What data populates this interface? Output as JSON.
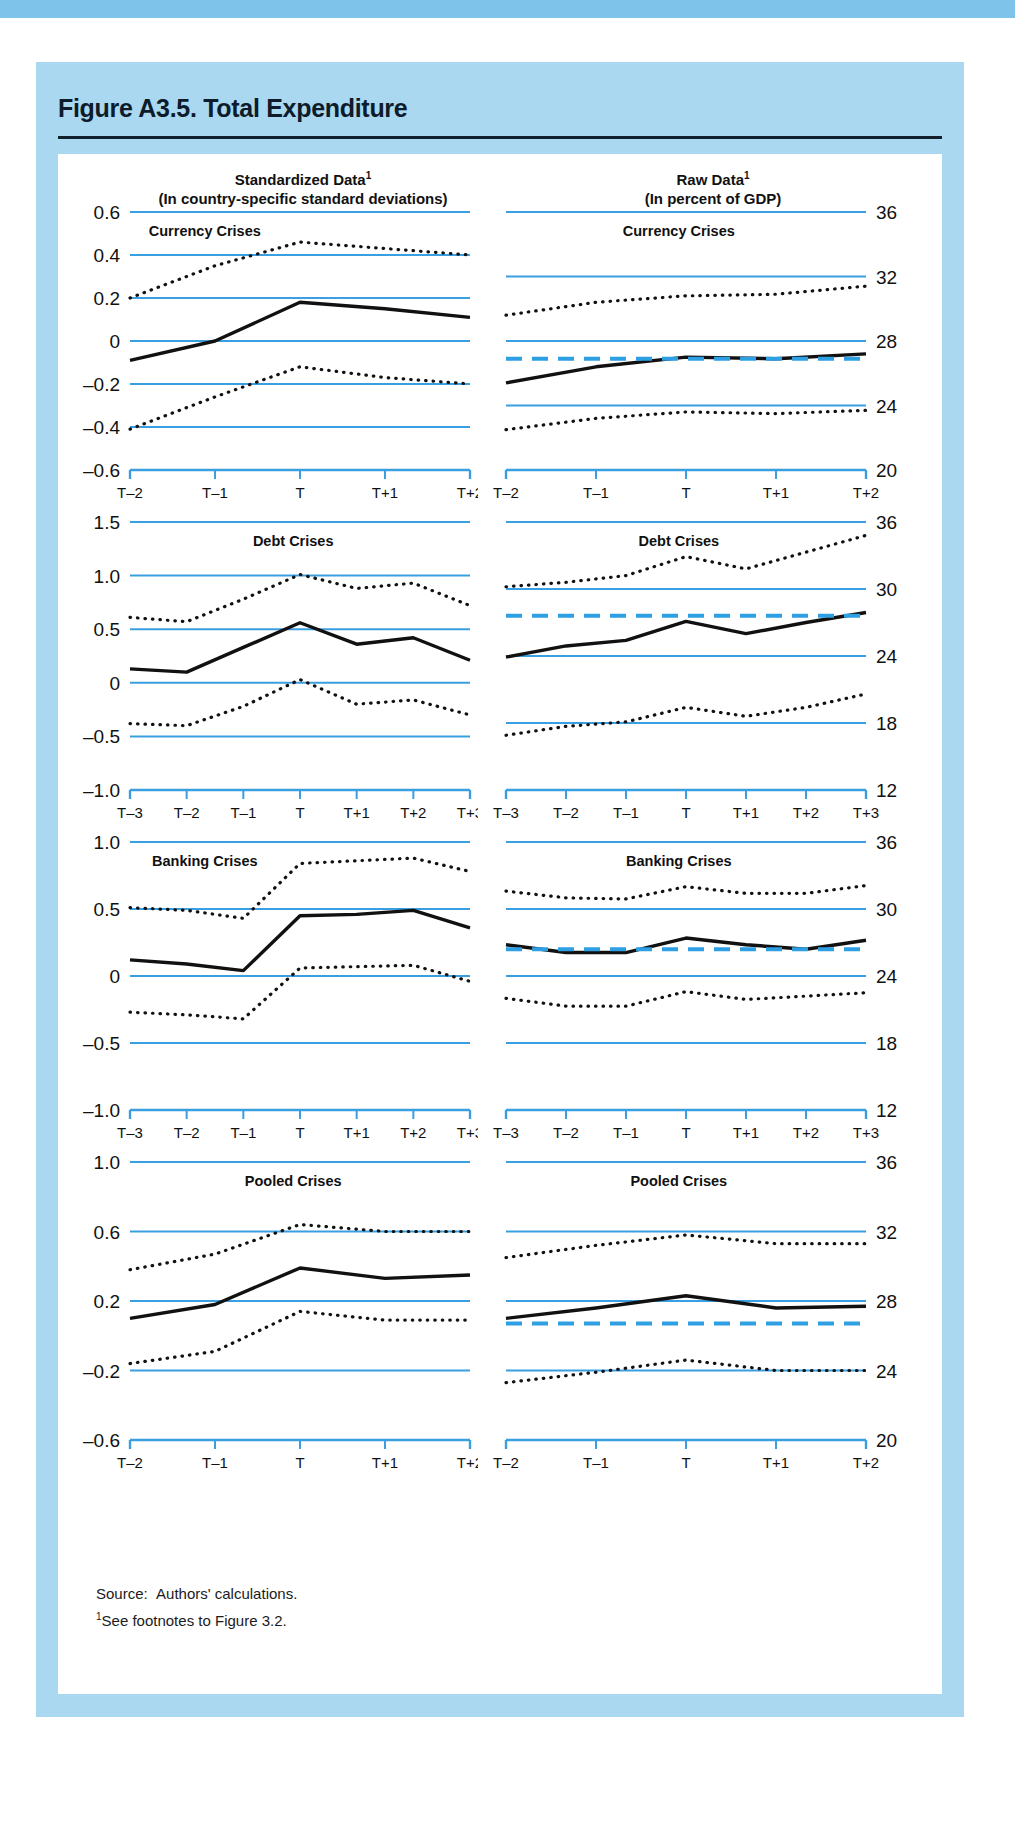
{
  "figure": {
    "title": "Figure A3.5. Total Expenditure",
    "source_label": "Source:",
    "source_text": "Authors' calculations.",
    "footnote_marker": "1",
    "footnote_text": "See footnotes to Figure 3.2.",
    "column_headings": [
      {
        "line1": "Standardized Data",
        "sup": "1",
        "line2": "(In country-specific standard deviations)"
      },
      {
        "line1": "Raw Data",
        "sup": "1",
        "line2": "(In percent of GDP)"
      }
    ],
    "colors": {
      "frame_blue": "#a9d8f0",
      "top_bar_blue": "#7ec4ea",
      "gridline_blue": "#3a9fe0",
      "dashed_blue": "#2f9fe4",
      "series_black": "#111111",
      "panel_background": "#ffffff"
    }
  },
  "chart_data": [
    {
      "type": "line",
      "title": "Currency Crises",
      "panel": "standardized",
      "xlabel": "",
      "ylabel": "",
      "x": [
        "T–2",
        "T–1",
        "T",
        "T+1",
        "T+2"
      ],
      "ylim": [
        -0.6,
        0.6
      ],
      "yticks": [
        -0.6,
        -0.4,
        -0.2,
        0,
        0.2,
        0.4,
        0.6
      ],
      "ytick_labels": [
        "–0.6",
        "–0.4",
        "–0.2",
        "0",
        "0.2",
        "0.4",
        "0.6"
      ],
      "grid": true,
      "series": [
        {
          "name": "median",
          "style": "solid",
          "values": [
            -0.09,
            0.0,
            0.18,
            0.15,
            0.11
          ]
        },
        {
          "name": "upper-quartile",
          "style": "dotted",
          "values": [
            0.2,
            0.35,
            0.46,
            0.43,
            0.4
          ]
        },
        {
          "name": "lower-quartile",
          "style": "dotted",
          "values": [
            -0.41,
            -0.26,
            -0.12,
            -0.17,
            -0.2
          ]
        }
      ]
    },
    {
      "type": "line",
      "title": "Currency Crises",
      "panel": "raw",
      "xlabel": "",
      "ylabel": "",
      "x": [
        "T–2",
        "T–1",
        "T",
        "T+1",
        "T+2"
      ],
      "ylim": [
        20,
        36
      ],
      "yticks": [
        20,
        24,
        28,
        32,
        36
      ],
      "ytick_labels": [
        "20",
        "24",
        "28",
        "32",
        "36"
      ],
      "grid": true,
      "series": [
        {
          "name": "median",
          "style": "solid",
          "values": [
            25.4,
            26.4,
            27.0,
            26.9,
            27.2
          ]
        },
        {
          "name": "upper-quartile",
          "style": "dotted",
          "values": [
            29.6,
            30.4,
            30.8,
            30.9,
            31.4
          ]
        },
        {
          "name": "lower-quartile",
          "style": "dotted",
          "values": [
            22.5,
            23.2,
            23.6,
            23.5,
            23.7
          ]
        },
        {
          "name": "tranquil-benchmark",
          "style": "dashed",
          "values": [
            26.9,
            26.9,
            26.9,
            26.9,
            26.9
          ]
        }
      ]
    },
    {
      "type": "line",
      "title": "Debt Crises",
      "panel": "standardized",
      "xlabel": "",
      "ylabel": "",
      "x": [
        "T–3",
        "T–2",
        "T–1",
        "T",
        "T+1",
        "T+2",
        "T+3"
      ],
      "ylim": [
        -1.0,
        1.5
      ],
      "yticks": [
        -1.0,
        -0.5,
        0,
        0.5,
        1.0,
        1.5
      ],
      "ytick_labels": [
        "–1.0",
        "–0.5",
        "0",
        "0.5",
        "1.0",
        "1.5"
      ],
      "grid": true,
      "series": [
        {
          "name": "median",
          "style": "solid",
          "values": [
            0.13,
            0.1,
            0.33,
            0.56,
            0.36,
            0.42,
            0.21
          ]
        },
        {
          "name": "upper-quartile",
          "style": "dotted",
          "values": [
            0.61,
            0.57,
            0.78,
            1.01,
            0.88,
            0.93,
            0.72
          ]
        },
        {
          "name": "lower-quartile",
          "style": "dotted",
          "values": [
            -0.38,
            -0.4,
            -0.22,
            0.03,
            -0.2,
            -0.16,
            -0.3
          ]
        }
      ]
    },
    {
      "type": "line",
      "title": "Debt Crises",
      "panel": "raw",
      "xlabel": "",
      "ylabel": "",
      "x": [
        "T–3",
        "T–2",
        "T–1",
        "T",
        "T+1",
        "T+2",
        "T+3"
      ],
      "ylim": [
        12,
        36
      ],
      "yticks": [
        12,
        18,
        24,
        30,
        36
      ],
      "ytick_labels": [
        "12",
        "18",
        "24",
        "30",
        "36"
      ],
      "grid": true,
      "series": [
        {
          "name": "median",
          "style": "solid",
          "values": [
            23.9,
            24.9,
            25.4,
            27.1,
            26.0,
            27.0,
            27.9
          ]
        },
        {
          "name": "upper-quartile",
          "style": "dotted",
          "values": [
            30.2,
            30.6,
            31.2,
            32.9,
            31.8,
            33.3,
            34.8
          ]
        },
        {
          "name": "lower-quartile",
          "style": "dotted",
          "values": [
            16.9,
            17.7,
            18.1,
            19.4,
            18.6,
            19.4,
            20.6
          ]
        },
        {
          "name": "tranquil-benchmark",
          "style": "dashed",
          "values": [
            27.6,
            27.6,
            27.6,
            27.6,
            27.6,
            27.6,
            27.6
          ]
        }
      ]
    },
    {
      "type": "line",
      "title": "Banking Crises",
      "panel": "standardized",
      "xlabel": "",
      "ylabel": "",
      "x": [
        "T–3",
        "T–2",
        "T–1",
        "T",
        "T+1",
        "T+2",
        "T+3"
      ],
      "ylim": [
        -1.0,
        1.0
      ],
      "yticks": [
        -1.0,
        -0.5,
        0,
        0.5,
        1.0
      ],
      "ytick_labels": [
        "–1.0",
        "–0.5",
        "0",
        "0.5",
        "1.0"
      ],
      "grid": true,
      "series": [
        {
          "name": "median",
          "style": "solid",
          "values": [
            0.12,
            0.09,
            0.04,
            0.45,
            0.46,
            0.49,
            0.36
          ]
        },
        {
          "name": "upper-quartile",
          "style": "dotted",
          "values": [
            0.51,
            0.49,
            0.43,
            0.84,
            0.86,
            0.88,
            0.78
          ]
        },
        {
          "name": "lower-quartile",
          "style": "dotted",
          "values": [
            -0.27,
            -0.29,
            -0.32,
            0.06,
            0.07,
            0.08,
            -0.04
          ]
        }
      ]
    },
    {
      "type": "line",
      "title": "Banking Crises",
      "panel": "raw",
      "xlabel": "",
      "ylabel": "",
      "x": [
        "T–3",
        "T–2",
        "T–1",
        "T",
        "T+1",
        "T+2",
        "T+3"
      ],
      "ylim": [
        12,
        36
      ],
      "yticks": [
        12,
        18,
        24,
        30,
        36
      ],
      "ytick_labels": [
        "12",
        "18",
        "24",
        "30",
        "36"
      ],
      "grid": true,
      "series": [
        {
          "name": "median",
          "style": "solid",
          "values": [
            26.8,
            26.1,
            26.1,
            27.4,
            26.8,
            26.4,
            27.2
          ]
        },
        {
          "name": "upper-quartile",
          "style": "dotted",
          "values": [
            31.6,
            31.0,
            30.9,
            32.0,
            31.4,
            31.4,
            32.1
          ]
        },
        {
          "name": "lower-quartile",
          "style": "dotted",
          "values": [
            22.0,
            21.3,
            21.3,
            22.6,
            21.9,
            22.2,
            22.5
          ]
        },
        {
          "name": "tranquil-benchmark",
          "style": "dashed",
          "values": [
            26.4,
            26.4,
            26.4,
            26.4,
            26.4,
            26.4,
            26.4
          ]
        }
      ]
    },
    {
      "type": "line",
      "title": "Pooled Crises",
      "panel": "standardized",
      "xlabel": "",
      "ylabel": "",
      "x": [
        "T–2",
        "T–1",
        "T",
        "T+1",
        "T+2"
      ],
      "ylim": [
        -0.6,
        1.0
      ],
      "yticks": [
        -0.6,
        -0.2,
        0.2,
        0.6,
        1.0
      ],
      "ytick_labels": [
        "–0.6",
        "–0.2",
        "0.2",
        "0.6",
        "1.0"
      ],
      "grid": true,
      "series": [
        {
          "name": "median",
          "style": "solid",
          "values": [
            0.1,
            0.18,
            0.39,
            0.33,
            0.35
          ]
        },
        {
          "name": "upper-quartile",
          "style": "dotted",
          "values": [
            0.38,
            0.47,
            0.64,
            0.6,
            0.6
          ]
        },
        {
          "name": "lower-quartile",
          "style": "dotted",
          "values": [
            -0.16,
            -0.09,
            0.14,
            0.09,
            0.09
          ]
        }
      ]
    },
    {
      "type": "line",
      "title": "Pooled Crises",
      "panel": "raw",
      "xlabel": "",
      "ylabel": "",
      "x": [
        "T–2",
        "T–1",
        "T",
        "T+1",
        "T+2"
      ],
      "ylim": [
        20,
        36
      ],
      "yticks": [
        20,
        24,
        28,
        32,
        36
      ],
      "ytick_labels": [
        "20",
        "24",
        "28",
        "32",
        "36"
      ],
      "grid": true,
      "series": [
        {
          "name": "median",
          "style": "solid",
          "values": [
            27.0,
            27.6,
            28.3,
            27.6,
            27.7
          ]
        },
        {
          "name": "upper-quartile",
          "style": "dotted",
          "values": [
            30.5,
            31.2,
            31.8,
            31.3,
            31.3
          ]
        },
        {
          "name": "lower-quartile",
          "style": "dotted",
          "values": [
            23.3,
            23.9,
            24.6,
            24.0,
            24.0
          ]
        },
        {
          "name": "tranquil-benchmark",
          "style": "dashed",
          "values": [
            26.7,
            26.7,
            26.7,
            26.7,
            26.7,
            26.7
          ]
        }
      ]
    }
  ]
}
